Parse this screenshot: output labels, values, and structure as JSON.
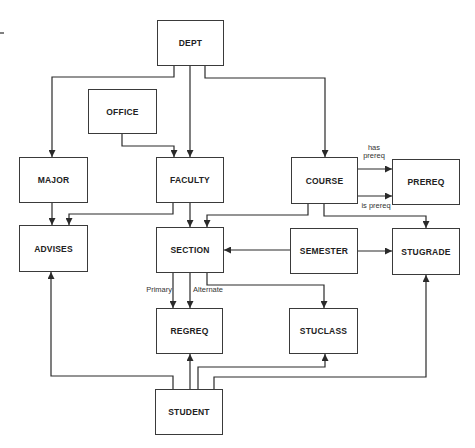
{
  "diagram": {
    "type": "data-structure-diagram",
    "entities": [
      {
        "id": "dept",
        "label": "DEPT"
      },
      {
        "id": "office",
        "label": "OFFICE"
      },
      {
        "id": "major",
        "label": "MAJOR"
      },
      {
        "id": "faculty",
        "label": "FACULTY"
      },
      {
        "id": "course",
        "label": "COURSE"
      },
      {
        "id": "prereq",
        "label": "PREREQ"
      },
      {
        "id": "advises",
        "label": "ADVISES"
      },
      {
        "id": "section",
        "label": "SECTION"
      },
      {
        "id": "semester",
        "label": "SEMESTER"
      },
      {
        "id": "stugrade",
        "label": "STUGRADE"
      },
      {
        "id": "regreq",
        "label": "REGREQ"
      },
      {
        "id": "stuclass",
        "label": "STUCLASS"
      },
      {
        "id": "student",
        "label": "STUDENT"
      }
    ],
    "edge_labels": {
      "has_prereq": "has prereq",
      "is_prereq": "is prereq",
      "primary": "Primary",
      "alternate": "Alternate"
    },
    "relationships": [
      {
        "from": "DEPT",
        "to": "MAJOR"
      },
      {
        "from": "DEPT",
        "to": "FACULTY"
      },
      {
        "from": "DEPT",
        "to": "COURSE"
      },
      {
        "from": "OFFICE",
        "to": "FACULTY"
      },
      {
        "from": "MAJOR",
        "to": "ADVISES"
      },
      {
        "from": "FACULTY",
        "to": "ADVISES"
      },
      {
        "from": "FACULTY",
        "to": "SECTION"
      },
      {
        "from": "COURSE",
        "to": "PREREQ",
        "label": "has prereq"
      },
      {
        "from": "COURSE",
        "to": "PREREQ",
        "label": "is prereq"
      },
      {
        "from": "COURSE",
        "to": "SECTION"
      },
      {
        "from": "COURSE",
        "to": "STUGRADE"
      },
      {
        "from": "SEMESTER",
        "to": "SECTION"
      },
      {
        "from": "SEMESTER",
        "to": "STUGRADE"
      },
      {
        "from": "SECTION",
        "to": "REGREQ",
        "label": "Primary"
      },
      {
        "from": "SECTION",
        "to": "REGREQ",
        "label": "Alternate"
      },
      {
        "from": "SECTION",
        "to": "STUCLASS"
      },
      {
        "from": "STUDENT",
        "to": "ADVISES"
      },
      {
        "from": "STUDENT",
        "to": "REGREQ"
      },
      {
        "from": "STUDENT",
        "to": "STUCLASS"
      },
      {
        "from": "STUDENT",
        "to": "STUGRADE"
      }
    ],
    "colors": {
      "line": "#2a2a2a",
      "box_border": "#3a3a3a",
      "background": "#ffffff"
    }
  }
}
